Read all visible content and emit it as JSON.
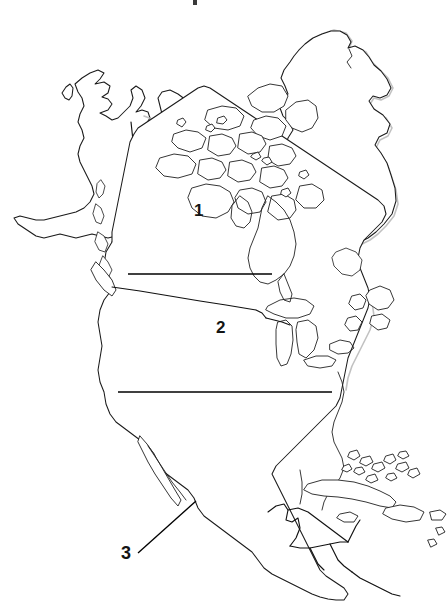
{
  "document": {
    "title": "North America Blank Outline Map",
    "type": "map",
    "background_color": "#ffffff",
    "outline_color": "#1a1a1a",
    "width": 447,
    "height": 613
  },
  "map": {
    "region": "North America",
    "style": "blank outline worksheet",
    "features_depicted": [
      "Alaska",
      "Canada",
      "Canadian Arctic Archipelago",
      "Greenland",
      "Hudson Bay",
      "Great Lakes",
      "United States",
      "Mexico",
      "Central America",
      "Cuba",
      "Bahamas",
      "Caribbean islands"
    ]
  },
  "labels": [
    {
      "id": "label-1",
      "text": "1",
      "refers_to": "Canada",
      "has_leader_line": true,
      "leader_style": "horizontal answer blank"
    },
    {
      "id": "label-2",
      "text": "2",
      "refers_to": "United States",
      "has_leader_line": true,
      "leader_style": "horizontal answer blank"
    },
    {
      "id": "label-3",
      "text": "3",
      "refers_to": "Mexico",
      "has_leader_line": true,
      "leader_style": "diagonal pointer"
    }
  ],
  "answer_lines": [
    {
      "name": "answer-line-1",
      "x1": 128,
      "y1": 274,
      "x2": 272,
      "y2": 274
    },
    {
      "name": "answer-line-2",
      "x1": 118,
      "y1": 392,
      "x2": 332,
      "y2": 392
    }
  ],
  "pointer_lines": [
    {
      "name": "pointer-line-3",
      "x1": 138,
      "y1": 553,
      "x2": 196,
      "y2": 501
    }
  ],
  "colors": {
    "ink": "#1a1a1a",
    "paper": "#ffffff",
    "shadow": "#b6b6b6"
  }
}
